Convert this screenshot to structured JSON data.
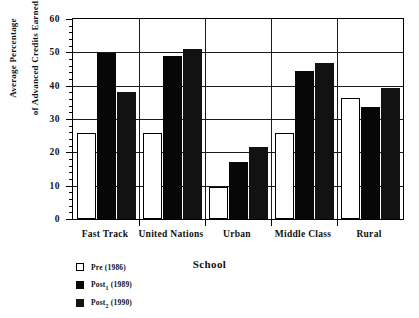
{
  "chart_data": {
    "type": "bar",
    "title": "",
    "xlabel": "School",
    "ylabel": "Average Percentage\nof Advanced Credits Earned",
    "ylabel_line1": "Average Percentage",
    "ylabel_line2": "of Advanced Credits Earned",
    "categories": [
      "Fast Track",
      "United Nations",
      "Urban",
      "Middle Class",
      "Rural"
    ],
    "series": [
      {
        "name": "Pre (1986)",
        "values": [
          25.7,
          25.7,
          9.7,
          25.7,
          36.4
        ]
      },
      {
        "name": "Post1 (1989)",
        "values": [
          49.8,
          49.0,
          17.2,
          44.3,
          33.5
        ]
      },
      {
        "name": "Post2 (1990)",
        "values": [
          38.0,
          51.0,
          21.7,
          46.8,
          39.3
        ]
      }
    ],
    "ylim": [
      0,
      60
    ],
    "yticks": [
      0,
      10,
      20,
      30,
      40,
      50,
      60
    ],
    "ytick_labels": [
      "0",
      "10",
      "20",
      "30",
      "40",
      "50",
      "60"
    ],
    "minor_tick_step": 2,
    "grid": "horizontal-and-group-dividers",
    "legend_position": "below-left"
  },
  "legend": {
    "entries": [
      {
        "label_main": "Pre",
        "label_sub": "",
        "label_year": "(1986)",
        "swatch": "open"
      },
      {
        "label_main": "Post",
        "label_sub": "1",
        "label_year": "(1989)",
        "swatch": "solid1"
      },
      {
        "label_main": "Post",
        "label_sub": "2",
        "label_year": "(1990)",
        "swatch": "solid2"
      }
    ]
  },
  "colors": {
    "pre": "#ffffff",
    "post1": "#070707",
    "post2": "#121212",
    "axis": "#000000",
    "grid": "#1a1a1a",
    "background": "#ffffff"
  }
}
